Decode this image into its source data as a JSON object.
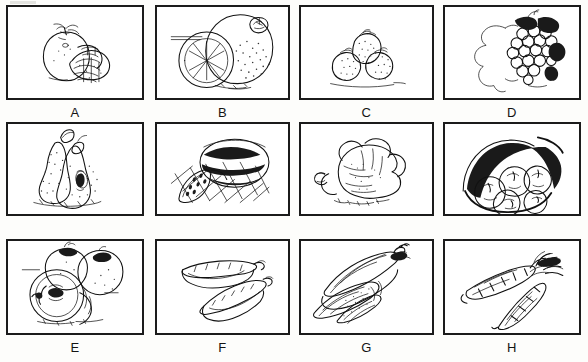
{
  "sheet": {
    "title": "Fruit and vegetable line-drawing picture grid",
    "background_color": "#fdfdfb",
    "panel_background": "#ffffff",
    "border_color": "#1b1b1b",
    "ink_color": "#111111",
    "columns": 4,
    "rows": 3,
    "panel_count": 12
  },
  "panels": [
    {
      "label": "A",
      "subject": "tomato-and-sliced-tomato",
      "subject_name": "Tomato",
      "icon": "tomato-icon",
      "row": 1,
      "column": 1
    },
    {
      "label": "B",
      "subject": "orange-with-slice",
      "subject_name": "Orange",
      "icon": "orange-icon",
      "row": 1,
      "column": 2
    },
    {
      "label": "C",
      "subject": "strawberries",
      "subject_name": "Strawberries",
      "icon": "strawberry-icon",
      "row": 1,
      "column": 3
    },
    {
      "label": "D",
      "subject": "grape-bunch-with-leaf",
      "subject_name": "Grapes",
      "icon": "grapes-icon",
      "row": 1,
      "column": 4
    },
    {
      "label": "E",
      "subject": "pears-whole-and-halved",
      "subject_name": "Pears",
      "icon": "pear-icon",
      "row": 2,
      "column": 1
    },
    {
      "label": "F",
      "subject": "watermelon-with-wedge-on-cloth",
      "subject_name": "Watermelon",
      "icon": "watermelon-icon",
      "row": 2,
      "column": 2
    },
    {
      "label": "G",
      "subject": "cabbage-head",
      "subject_name": "Cabbage",
      "icon": "cabbage-icon",
      "row": 2,
      "column": 3
    },
    {
      "label": "H",
      "subject": "potatoes-in-sack",
      "subject_name": "Potatoes",
      "icon": "potato-icon",
      "row": 2,
      "column": 4
    },
    {
      "label": "I",
      "subject": "apples-whole-and-halved",
      "subject_name": "Apples",
      "icon": "apple-icon",
      "row": 3,
      "column": 1
    },
    {
      "label": "J",
      "subject": "two-pea-pods",
      "subject_name": "Pea pods",
      "icon": "pea-pod-icon",
      "row": 3,
      "column": 2
    },
    {
      "label": "K",
      "subject": "corn-cobs-with-husk",
      "subject_name": "Corn",
      "icon": "corn-icon",
      "row": 3,
      "column": 3
    },
    {
      "label": "L",
      "subject": "two-carrots-with-tops",
      "subject_name": "Carrots",
      "icon": "carrot-icon",
      "row": 3,
      "column": 4
    }
  ]
}
